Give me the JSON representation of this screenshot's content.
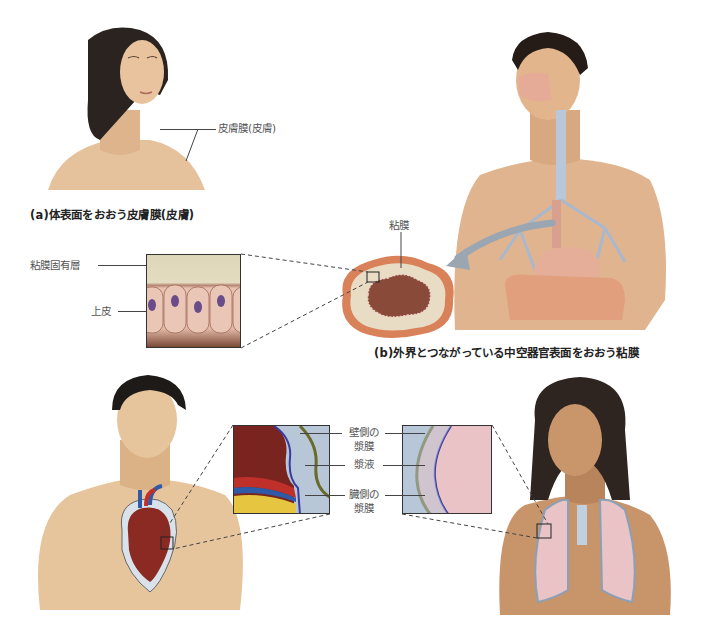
{
  "figure": {
    "panel_a": {
      "label_skin_membrane": "皮膚膜(皮膚)",
      "caption": "(a)体表面をおおう皮膚膜(皮膚)"
    },
    "panel_b": {
      "label_mucosa": "粘膜",
      "label_lamina_propria": "粘膜固有層",
      "label_epithelium": "上皮",
      "caption": "(b)外界とつながっている中空器官表面をおおう粘膜"
    },
    "panel_c": {
      "label_parietal_line1": "壁側の",
      "label_parietal_line2": "漿膜",
      "label_serous_fluid": "漿液",
      "label_visceral_line1": "臓側の",
      "label_visceral_line2": "漿膜"
    },
    "colors": {
      "skin": "#e8c39e",
      "skin_shadow": "#c99a70",
      "hair": "#2b2320",
      "mucosa_outer": "#d9825a",
      "mucosa_lumen": "#8a4a3a",
      "serous_blue": "#b7c7d8",
      "heart_red": "#8b2a22",
      "lung_pink": "#e9c3c6",
      "arrow_gray": "#9aa6b2"
    }
  }
}
